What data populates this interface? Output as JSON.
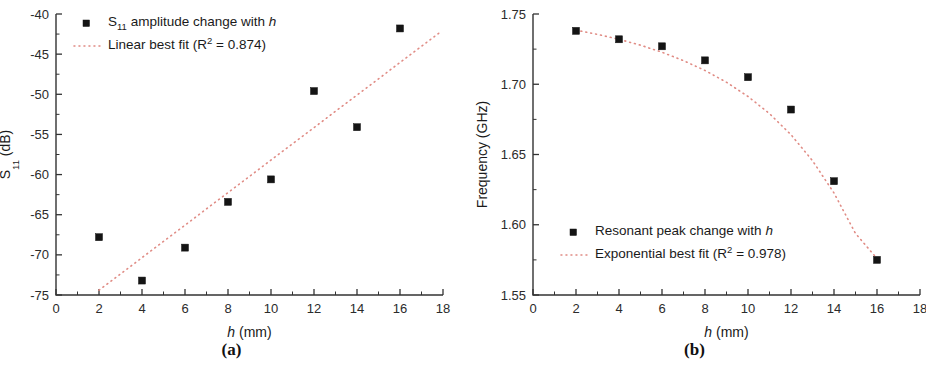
{
  "figure": {
    "background": "#ffffff",
    "marker_color": "#141414",
    "fit_color": "#e08b84",
    "axis_color": "#333333",
    "panel_count": 2
  },
  "panels": [
    {
      "id": "a",
      "caption": "(a)",
      "xlabel_italic": "h",
      "xlabel_rest": " (mm)",
      "ylabel_main": "S",
      "ylabel_sub": "11",
      "ylabel_rest": " (dB)",
      "x_ticks": [
        "0",
        "2",
        "4",
        "6",
        "8",
        "10",
        "12",
        "14",
        "16",
        "18"
      ],
      "y_ticks": [
        "-40",
        "-45",
        "-50",
        "-55",
        "-60",
        "-65",
        "-70",
        "-75"
      ],
      "legend": [
        {
          "marker": "square",
          "prefix": "S",
          "sub": "11",
          "text": " amplitude change with ",
          "italic_tail": "h"
        },
        {
          "marker": "dotted-line",
          "prefix": "Linear best fit (R",
          "sup": "2",
          "text": " = 0.874)",
          "italic_tail": ""
        }
      ]
    },
    {
      "id": "b",
      "caption": "(b)",
      "xlabel_italic": "h",
      "xlabel_rest": " (mm)",
      "ylabel_main": "Frequency (GHz)",
      "ylabel_sub": "",
      "ylabel_rest": "",
      "x_ticks": [
        "0",
        "2",
        "4",
        "6",
        "8",
        "10",
        "12",
        "14",
        "16",
        "18"
      ],
      "y_ticks": [
        "1.75",
        "1.70",
        "1.65",
        "1.60",
        "1.55"
      ],
      "legend": [
        {
          "marker": "square",
          "prefix": "Resonant peak change with ",
          "sub": "",
          "text": "",
          "italic_tail": "h"
        },
        {
          "marker": "dotted-line",
          "prefix": "Exponential best fit (R",
          "sup": "2",
          "text": " = 0.978)",
          "italic_tail": ""
        }
      ]
    }
  ],
  "chart_data": [
    {
      "type": "scatter",
      "panel": "(a)",
      "title": "",
      "xlabel": "h (mm)",
      "ylabel": "S11 (dB)",
      "xlim": [
        0,
        18
      ],
      "ylim": [
        -75,
        -40
      ],
      "x_tick_step": 2,
      "y_tick_step": 5,
      "x_minor_ticks": true,
      "y_minor_ticks": true,
      "grid": false,
      "legend_position": "top-left",
      "x": [
        2,
        4,
        6,
        8,
        10,
        12,
        14,
        16
      ],
      "values": [
        -67.8,
        -73.2,
        -69.1,
        -63.4,
        -60.6,
        -49.6,
        -54.1,
        -41.8
      ],
      "series": [
        {
          "name": "S11 amplitude change with h",
          "style": "filled-square-markers",
          "x": [
            2,
            4,
            6,
            8,
            10,
            12,
            14,
            16
          ],
          "values": [
            -67.8,
            -73.2,
            -69.1,
            -63.4,
            -60.6,
            -49.6,
            -54.1,
            -41.8
          ]
        },
        {
          "name": "Linear best fit (R2 = 0.874)",
          "style": "dotted-line",
          "fit": "linear",
          "r_squared": 0.874,
          "x": [
            2.0,
            17.8
          ],
          "values": [
            -74.4,
            -42.4
          ]
        }
      ]
    },
    {
      "type": "scatter",
      "panel": "(b)",
      "title": "",
      "xlabel": "h (mm)",
      "ylabel": "Frequency (GHz)",
      "xlim": [
        0,
        18
      ],
      "ylim": [
        1.55,
        1.75
      ],
      "x_tick_step": 2,
      "y_tick_step": 0.05,
      "x_minor_ticks": true,
      "y_minor_ticks": true,
      "grid": false,
      "legend_position": "bottom-left",
      "x": [
        2,
        4,
        6,
        8,
        10,
        12,
        14,
        16
      ],
      "values": [
        1.738,
        1.732,
        1.727,
        1.717,
        1.705,
        1.682,
        1.631,
        1.575
      ],
      "series": [
        {
          "name": "Resonant peak change with h",
          "style": "filled-square-markers",
          "x": [
            2,
            4,
            6,
            8,
            10,
            12,
            14,
            16
          ],
          "values": [
            1.738,
            1.732,
            1.727,
            1.717,
            1.705,
            1.682,
            1.631,
            1.575
          ]
        },
        {
          "name": "Exponential best fit (R2 = 0.978)",
          "style": "dotted-line",
          "fit": "exponential",
          "r_squared": 0.978,
          "x": [
            2,
            3,
            4,
            5,
            6,
            7,
            8,
            9,
            10,
            11,
            12,
            13,
            14,
            15,
            16
          ],
          "values": [
            1.7385,
            1.7355,
            1.732,
            1.7278,
            1.7228,
            1.7168,
            1.7098,
            1.7014,
            1.6913,
            1.6791,
            1.6641,
            1.6456,
            1.6226,
            1.5938,
            1.576
          ]
        }
      ]
    }
  ]
}
